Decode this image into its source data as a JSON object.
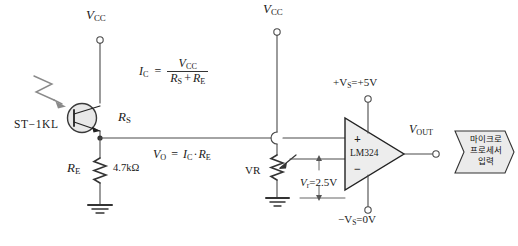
{
  "diagram": {
    "background": "#ffffff",
    "line_color": "#4a4a4a",
    "supplies": {
      "vcc_left": "V",
      "vcc_left_sub": "CC",
      "vcc_right": "V",
      "vcc_right_sub": "CC",
      "vs_pos": "+V",
      "vs_pos_sub": "S",
      "vs_pos_val": "=+5V",
      "vs_neg": "−V",
      "vs_neg_sub": "S",
      "vs_neg_val": "=0V"
    },
    "components": {
      "phototransistor": "ST−1KL",
      "rs_label": "R",
      "rs_sub": "S",
      "re_label": "R",
      "re_sub": "E",
      "re_value": "4.7kΩ",
      "vr_label": "VR",
      "opamp": "LM324",
      "opamp_plus": "+",
      "opamp_minus": "−"
    },
    "formulas": {
      "ic_lhs": "I",
      "ic_lhs_sub": "C",
      "ic_eq": "=",
      "ic_num": "V",
      "ic_num_sub": "CC",
      "ic_den_a": "R",
      "ic_den_a_sub": "S",
      "ic_den_plus": "+",
      "ic_den_b": "R",
      "ic_den_b_sub": "E",
      "vo_lhs": "V",
      "vo_lhs_sub": "O",
      "vo_eq": "=",
      "vo_rhs_a": "I",
      "vo_rhs_a_sub": "C",
      "vo_dot": "·",
      "vo_rhs_b": "R",
      "vo_rhs_b_sub": "E",
      "vr_ref": "V",
      "vr_ref_sub": "r",
      "vr_ref_val": "=2.5V"
    },
    "output": {
      "vout": "V",
      "vout_sub": "OUT",
      "dest_line1": "마이크로",
      "dest_line2": "프로세서",
      "dest_line3": "입력"
    }
  }
}
